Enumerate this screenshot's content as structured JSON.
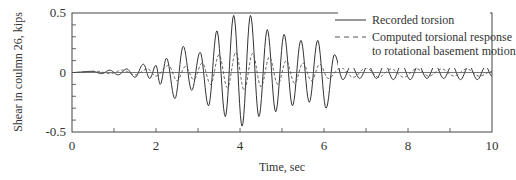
{
  "chart_data": {
    "type": "line",
    "title": "",
    "xlabel": "Time, sec",
    "ylabel": "Shear in coulmn 26, kips",
    "xlim": [
      0,
      10
    ],
    "ylim": [
      -0.5,
      0.5
    ],
    "xticks": [
      0,
      2,
      4,
      6,
      8,
      10
    ],
    "xtick_labels": [
      "0",
      "2",
      "4",
      "6",
      "8",
      "10"
    ],
    "yticks": [
      -0.5,
      0,
      0.5
    ],
    "ytick_labels": [
      "-0.5",
      "0",
      "0.5"
    ],
    "grid": false,
    "legend_position": "upper right",
    "series": [
      {
        "name": "Recorded torsion",
        "style": "solid",
        "color": "#333333",
        "peaks": [
          [
            0.0,
            0.0
          ],
          [
            0.5,
            0.01
          ],
          [
            0.7,
            -0.01
          ],
          [
            0.9,
            0.02
          ],
          [
            1.1,
            -0.02
          ],
          [
            1.3,
            0.03
          ],
          [
            1.5,
            -0.04
          ],
          [
            1.7,
            0.07
          ],
          [
            1.85,
            -0.05
          ],
          [
            2.0,
            0.06
          ],
          [
            2.1,
            -0.1
          ],
          [
            2.25,
            0.12
          ],
          [
            2.45,
            -0.22
          ],
          [
            2.65,
            0.22
          ],
          [
            2.85,
            -0.15
          ],
          [
            3.05,
            0.17
          ],
          [
            3.25,
            -0.28
          ],
          [
            3.45,
            0.35
          ],
          [
            3.65,
            -0.37
          ],
          [
            3.85,
            0.48
          ],
          [
            4.05,
            -0.45
          ],
          [
            4.25,
            0.48
          ],
          [
            4.45,
            -0.37
          ],
          [
            4.65,
            0.36
          ],
          [
            4.85,
            -0.33
          ],
          [
            5.05,
            0.32
          ],
          [
            5.25,
            -0.28
          ],
          [
            5.45,
            0.27
          ],
          [
            5.65,
            -0.25
          ],
          [
            5.85,
            0.27
          ],
          [
            6.05,
            -0.3
          ],
          [
            6.25,
            0.15
          ],
          [
            6.45,
            -0.06
          ],
          [
            6.65,
            0.06
          ],
          [
            6.85,
            -0.05
          ],
          [
            7.05,
            0.06
          ],
          [
            7.25,
            -0.05
          ],
          [
            7.45,
            0.07
          ],
          [
            7.65,
            -0.06
          ],
          [
            7.85,
            0.07
          ],
          [
            8.05,
            -0.06
          ],
          [
            8.25,
            0.06
          ],
          [
            8.45,
            -0.05
          ],
          [
            8.65,
            0.06
          ],
          [
            8.85,
            -0.05
          ],
          [
            9.05,
            0.06
          ],
          [
            9.25,
            -0.06
          ],
          [
            9.45,
            0.06
          ],
          [
            9.65,
            -0.06
          ],
          [
            9.85,
            0.05
          ],
          [
            10.0,
            -0.03
          ]
        ]
      },
      {
        "name": "Computed torsional response to rotational basement motion",
        "style": "dashed",
        "color": "#555555",
        "peaks": [
          [
            0.0,
            0.0
          ],
          [
            0.6,
            0.01
          ],
          [
            0.9,
            -0.01
          ],
          [
            1.2,
            0.02
          ],
          [
            1.5,
            -0.02
          ],
          [
            1.8,
            0.03
          ],
          [
            2.0,
            -0.03
          ],
          [
            2.3,
            0.06
          ],
          [
            2.5,
            -0.07
          ],
          [
            2.7,
            0.05
          ],
          [
            2.9,
            -0.06
          ],
          [
            3.1,
            0.08
          ],
          [
            3.3,
            -0.1
          ],
          [
            3.5,
            0.15
          ],
          [
            3.7,
            -0.13
          ],
          [
            3.9,
            0.17
          ],
          [
            4.1,
            -0.15
          ],
          [
            4.3,
            0.16
          ],
          [
            4.5,
            -0.12
          ],
          [
            4.7,
            0.13
          ],
          [
            4.9,
            -0.1
          ],
          [
            5.1,
            0.1
          ],
          [
            5.3,
            -0.09
          ],
          [
            5.5,
            0.08
          ],
          [
            5.7,
            -0.07
          ],
          [
            5.9,
            0.07
          ],
          [
            6.1,
            -0.05
          ],
          [
            6.4,
            0.04
          ],
          [
            6.7,
            -0.04
          ],
          [
            7.0,
            0.04
          ],
          [
            7.3,
            -0.04
          ],
          [
            7.6,
            0.03
          ],
          [
            7.9,
            -0.04
          ],
          [
            8.2,
            0.03
          ],
          [
            8.5,
            -0.03
          ],
          [
            8.8,
            0.03
          ],
          [
            9.1,
            -0.03
          ],
          [
            9.4,
            0.03
          ],
          [
            9.7,
            -0.03
          ],
          [
            10.0,
            0.01
          ]
        ]
      }
    ]
  },
  "legend": {
    "items": [
      {
        "label_lines": [
          "Recorded torsion"
        ]
      },
      {
        "label_lines": [
          "Computed torsional response",
          "to rotational basement motion"
        ]
      }
    ]
  }
}
